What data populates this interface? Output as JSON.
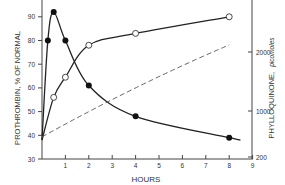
{
  "chart_data": {
    "type": "line",
    "title": "",
    "xlabel": "HOURS",
    "ylabel": "PROTHROMBIN, % OF NORMAL",
    "y2label_main": "PHYLLOQUINONE,",
    "y2label_unit": "picomoles",
    "x_ticks": [
      "1",
      "2",
      "3",
      "4",
      "5",
      "6",
      "7",
      "8",
      "9"
    ],
    "y_ticks": [
      "30",
      "40",
      "50",
      "60",
      "70",
      "80",
      "90"
    ],
    "y2_ticks": [
      "200",
      "1000",
      "2000"
    ],
    "xlim": [
      0,
      9
    ],
    "ylim": [
      30,
      95
    ],
    "grid": false,
    "series": [
      {
        "name": "Prothrombin (filled circles)",
        "marker": "filled-circle",
        "style": "solid",
        "x": [
          0,
          0.25,
          0.5,
          1,
          2,
          4,
          8
        ],
        "y": [
          38,
          80,
          92,
          80,
          61,
          48,
          39
        ]
      },
      {
        "name": "Prothrombin (open circles)",
        "marker": "open-circle",
        "style": "solid",
        "x": [
          0,
          0.5,
          1,
          2,
          4,
          8
        ],
        "y": [
          38,
          56,
          64.5,
          78,
          83,
          90
        ]
      },
      {
        "name": "Phylloquinone",
        "marker": "none",
        "style": "dashed",
        "axis": "right",
        "x": [
          0,
          8
        ],
        "y": [
          550,
          2120
        ]
      }
    ]
  }
}
